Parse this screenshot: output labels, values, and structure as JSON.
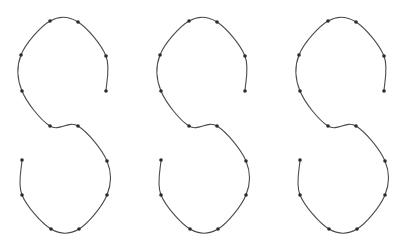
{
  "figure": {
    "width": 406,
    "height": 248,
    "background": "#ffffff",
    "stroke_color": "#4a4a4a",
    "point_color": "#2b2b2b",
    "point_radius": 1.8
  },
  "base_shape": {
    "name": "S-curve",
    "control_points": [
      [
        106,
        91
      ],
      [
        106,
        56
      ],
      [
        78,
        22
      ],
      [
        50,
        21
      ],
      [
        21,
        55
      ],
      [
        22,
        91
      ],
      [
        50,
        126
      ],
      [
        78,
        126
      ],
      [
        107,
        161
      ],
      [
        107,
        195
      ],
      [
        79,
        229
      ],
      [
        51,
        229
      ],
      [
        22,
        195
      ],
      [
        22,
        160
      ]
    ]
  },
  "shapes": [
    {
      "label": "S-curve-1",
      "offset_x": 0
    },
    {
      "label": "S-curve-2",
      "offset_x": 139
    },
    {
      "label": "S-curve-3",
      "offset_x": 278
    }
  ]
}
